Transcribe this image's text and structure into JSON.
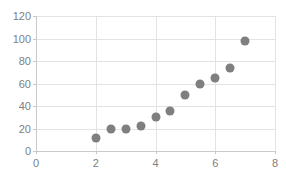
{
  "chart_data": {
    "type": "scatter",
    "title": "",
    "xlabel": "",
    "ylabel": "",
    "xlim": [
      0,
      8
    ],
    "ylim": [
      0,
      120
    ],
    "xticks": [
      0,
      2,
      4,
      6,
      8
    ],
    "yticks": [
      0,
      20,
      40,
      60,
      80,
      100,
      120
    ],
    "xtick_labels": [
      "0",
      "2",
      "4",
      "6",
      "8"
    ],
    "ytick_labels": [
      "0",
      "20",
      "40",
      "60",
      "80",
      "100",
      "120"
    ],
    "grid": true,
    "grid_axis": "both",
    "legend": null,
    "series": [
      {
        "name": "series-1",
        "marker": "circle",
        "color": "#7f7f7f",
        "points": [
          {
            "x": 2.0,
            "y": 12
          },
          {
            "x": 2.5,
            "y": 20
          },
          {
            "x": 3.0,
            "y": 20
          },
          {
            "x": 3.5,
            "y": 22
          },
          {
            "x": 4.0,
            "y": 30
          },
          {
            "x": 4.5,
            "y": 36
          },
          {
            "x": 5.0,
            "y": 50
          },
          {
            "x": 5.5,
            "y": 60
          },
          {
            "x": 6.0,
            "y": 65
          },
          {
            "x": 6.5,
            "y": 74
          },
          {
            "x": 7.0,
            "y": 98
          }
        ]
      }
    ],
    "colors": {
      "marker": "#7f7f7f",
      "grid": "#e3e3e3",
      "axis": "#c9c9c9",
      "tick_text": "#808080",
      "background": "#ffffff"
    }
  }
}
